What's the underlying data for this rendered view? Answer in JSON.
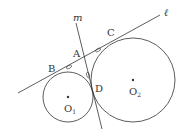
{
  "diagram": {
    "type": "geometry",
    "colors": {
      "stroke": "#333333",
      "background": "#ffffff"
    },
    "lines": {
      "l": {
        "label": "ℓ",
        "x1": 18,
        "y1": 93,
        "x2": 160,
        "y2": 15
      },
      "m": {
        "label": "m",
        "x1": 76,
        "y1": 23,
        "x2": 102,
        "y2": 129
      }
    },
    "circles": [
      {
        "name": "O1",
        "cx": 68,
        "cy": 97,
        "r": 25,
        "center_label": "O",
        "center_sub": "1"
      },
      {
        "name": "O2",
        "cx": 133,
        "cy": 80,
        "r": 42,
        "center_label": "O",
        "center_sub": "2"
      }
    ],
    "points": [
      {
        "name": "A",
        "label": "A",
        "x": 76,
        "y": 56
      },
      {
        "name": "B",
        "label": "B",
        "x": 50,
        "y": 70
      },
      {
        "name": "C",
        "label": "C",
        "x": 113,
        "y": 35
      },
      {
        "name": "D",
        "label": "D",
        "x": 98,
        "y": 86
      }
    ],
    "tick_marks": [
      "AB",
      "AC",
      "AD"
    ]
  }
}
